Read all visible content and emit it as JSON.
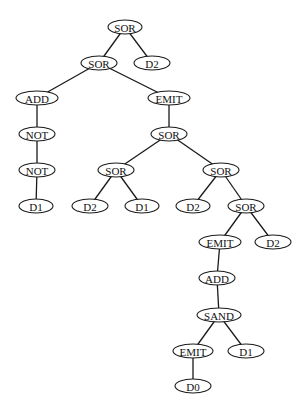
{
  "diagram": {
    "type": "tree",
    "colors": {
      "stroke": "#1a1a1a",
      "fill": "#ffffff",
      "text": "#111111",
      "background": "#ffffff"
    },
    "nodes": [
      {
        "id": "n0",
        "label": "SOR",
        "x": 125,
        "y": 27,
        "rx": 17,
        "ry": 7
      },
      {
        "id": "n1",
        "label": "SOR",
        "x": 99,
        "y": 63,
        "rx": 18,
        "ry": 7
      },
      {
        "id": "n2",
        "label": "D2",
        "x": 152,
        "y": 63,
        "rx": 18,
        "ry": 7
      },
      {
        "id": "n3",
        "label": "ADD",
        "x": 37,
        "y": 98,
        "rx": 21,
        "ry": 7
      },
      {
        "id": "n4",
        "label": "EMIT",
        "x": 169,
        "y": 98,
        "rx": 21,
        "ry": 7
      },
      {
        "id": "n5",
        "label": "NOT",
        "x": 37,
        "y": 134,
        "rx": 18,
        "ry": 7
      },
      {
        "id": "n6",
        "label": "SOR",
        "x": 169,
        "y": 134,
        "rx": 18,
        "ry": 7
      },
      {
        "id": "n7",
        "label": "NOT",
        "x": 37,
        "y": 170,
        "rx": 18,
        "ry": 7
      },
      {
        "id": "n8",
        "label": "SOR",
        "x": 116,
        "y": 170,
        "rx": 18,
        "ry": 7
      },
      {
        "id": "n9",
        "label": "SOR",
        "x": 221,
        "y": 170,
        "rx": 18,
        "ry": 7
      },
      {
        "id": "n10",
        "label": "D1",
        "x": 36,
        "y": 206,
        "rx": 17,
        "ry": 7
      },
      {
        "id": "n11",
        "label": "D2",
        "x": 90,
        "y": 206,
        "rx": 18,
        "ry": 7
      },
      {
        "id": "n12",
        "label": "D1",
        "x": 142,
        "y": 206,
        "rx": 17,
        "ry": 7
      },
      {
        "id": "n13",
        "label": "D2",
        "x": 193,
        "y": 206,
        "rx": 17,
        "ry": 7
      },
      {
        "id": "n14",
        "label": "SOR",
        "x": 246,
        "y": 206,
        "rx": 18,
        "ry": 7
      },
      {
        "id": "n15",
        "label": "EMIT",
        "x": 220,
        "y": 242,
        "rx": 21,
        "ry": 7
      },
      {
        "id": "n16",
        "label": "D2",
        "x": 273,
        "y": 242,
        "rx": 18,
        "ry": 7
      },
      {
        "id": "n17",
        "label": "ADD",
        "x": 217,
        "y": 278,
        "rx": 18,
        "ry": 7
      },
      {
        "id": "n18",
        "label": "SAND",
        "x": 219,
        "y": 315,
        "rx": 22,
        "ry": 7
      },
      {
        "id": "n19",
        "label": "EMIT",
        "x": 193,
        "y": 351,
        "rx": 20,
        "ry": 7
      },
      {
        "id": "n20",
        "label": "D1",
        "x": 246,
        "y": 351,
        "rx": 18,
        "ry": 7
      },
      {
        "id": "n21",
        "label": "D0",
        "x": 193,
        "y": 386,
        "rx": 18,
        "ry": 7
      }
    ],
    "edges": [
      [
        "n0",
        "n1"
      ],
      [
        "n0",
        "n2"
      ],
      [
        "n1",
        "n3"
      ],
      [
        "n1",
        "n4"
      ],
      [
        "n3",
        "n5"
      ],
      [
        "n5",
        "n7"
      ],
      [
        "n7",
        "n10"
      ],
      [
        "n4",
        "n6"
      ],
      [
        "n6",
        "n8"
      ],
      [
        "n6",
        "n9"
      ],
      [
        "n8",
        "n11"
      ],
      [
        "n8",
        "n12"
      ],
      [
        "n9",
        "n13"
      ],
      [
        "n9",
        "n14"
      ],
      [
        "n14",
        "n15"
      ],
      [
        "n14",
        "n16"
      ],
      [
        "n15",
        "n17"
      ],
      [
        "n17",
        "n18"
      ],
      [
        "n18",
        "n19"
      ],
      [
        "n18",
        "n20"
      ],
      [
        "n19",
        "n21"
      ]
    ]
  }
}
